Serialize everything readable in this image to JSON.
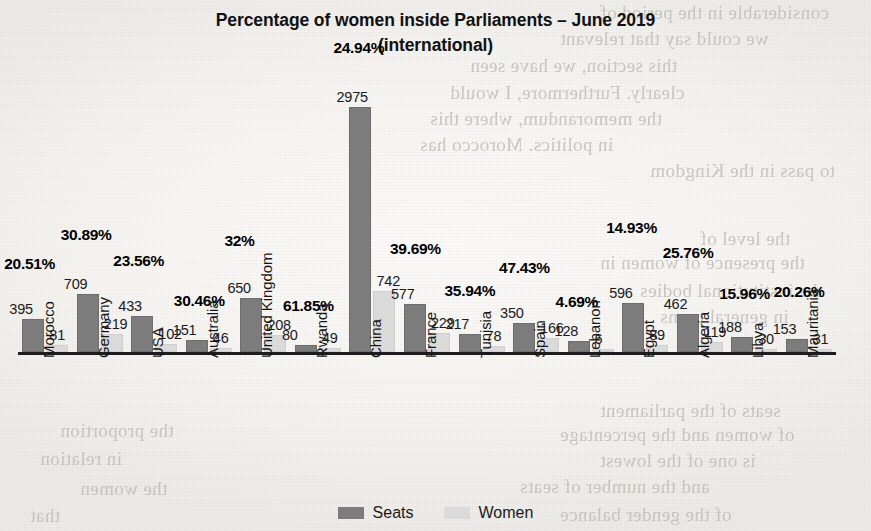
{
  "chart_data": {
    "type": "bar",
    "title": "Percentage of women inside Parliaments – June 2019",
    "subtitle": "(international)",
    "xlabel": "",
    "ylabel": "",
    "grid": false,
    "legend_position": "bottom",
    "ylim": [
      0,
      3100
    ],
    "categories": [
      "Morocco",
      "Germany",
      "USA",
      "Australia",
      "United Kingdom",
      "Rwanda",
      "China",
      "France",
      "Tunisia",
      "Spain",
      "Lebanon",
      "Egypt",
      "Algeria",
      "Libya",
      "Mauritania"
    ],
    "series": [
      {
        "name": "Seats",
        "color": "#7c7c7c",
        "values": [
          395,
          709,
          433,
          151,
          650,
          80,
          2975,
          577,
          217,
          350,
          128,
          596,
          462,
          188,
          153
        ]
      },
      {
        "name": "Women",
        "color": "#dadada",
        "values": [
          81,
          219,
          102,
          46,
          208,
          49,
          742,
          229,
          78,
          166,
          6,
          89,
          119,
          30,
          31
        ]
      }
    ],
    "annotations": {
      "label": "percentage of women",
      "values": [
        "20.51%",
        "30.89%",
        "23.56%",
        "30.46%",
        "32%",
        "61.85%",
        "24.94%",
        "39.69%",
        "35.94%",
        "47.43%",
        "4.69%",
        "14.93%",
        "25.76%",
        "15.96%",
        "20.26%"
      ]
    }
  },
  "legend": {
    "items": [
      {
        "label": "Seats",
        "swatch": "seats"
      },
      {
        "label": "Women",
        "swatch": "women"
      }
    ]
  },
  "background": {
    "bleed_lines": [
      {
        "text": "considerable in the period of",
        "x": 600,
        "y": 2
      },
      {
        "text": "we could say that relevant",
        "x": 560,
        "y": 28
      },
      {
        "text": "this section, we have seen",
        "x": 470,
        "y": 55
      },
      {
        "text": "clearly. Furthermore, I would",
        "x": 450,
        "y": 82
      },
      {
        "text": "the memorandum, where this",
        "x": 430,
        "y": 108
      },
      {
        "text": "in politics. Morocco has",
        "x": 420,
        "y": 134
      },
      {
        "text": "to pass in the Kingdom",
        "x": 650,
        "y": 160
      },
      {
        "text": "the level of",
        "x": 700,
        "y": 228
      },
      {
        "text": "the presence of women in",
        "x": 600,
        "y": 252
      },
      {
        "text": "the institutional bodies",
        "x": 640,
        "y": 280
      },
      {
        "text": "in general terms",
        "x": 660,
        "y": 306
      },
      {
        "text": "seats of the parliament",
        "x": 600,
        "y": 400
      },
      {
        "text": "of women and the percentage",
        "x": 560,
        "y": 424
      },
      {
        "text": "is one of the lowest",
        "x": 600,
        "y": 450
      },
      {
        "text": "and the number of seats",
        "x": 520,
        "y": 476
      },
      {
        "text": "of the gender balance",
        "x": 560,
        "y": 504
      },
      {
        "text": "the proportion",
        "x": 60,
        "y": 420
      },
      {
        "text": "in relation",
        "x": 40,
        "y": 448
      },
      {
        "text": "the women",
        "x": 80,
        "y": 478
      },
      {
        "text": "that",
        "x": 30,
        "y": 505
      }
    ]
  }
}
